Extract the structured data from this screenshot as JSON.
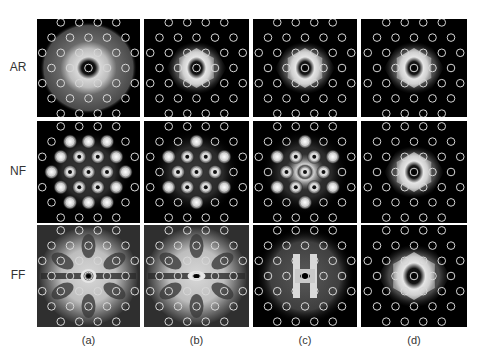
{
  "figure": {
    "row_labels": [
      "AR",
      "NF",
      "FF"
    ],
    "col_labels": [
      "(a)",
      "(b)",
      "(c)",
      "(d)"
    ],
    "panel_background": "#000000",
    "lattice_circle_color": "#d8d8d8",
    "lattice_rows": [
      4,
      5,
      6,
      5,
      6,
      5,
      4
    ]
  },
  "panels": [
    {
      "row": "AR",
      "col": "(a)",
      "pattern": "wide-diffuse-glow-dark-core"
    },
    {
      "row": "AR",
      "col": "(b)",
      "pattern": "hexagonal-ring-dark-core"
    },
    {
      "row": "AR",
      "col": "(c)",
      "pattern": "hexagonal-ring-dark-core"
    },
    {
      "row": "AR",
      "col": "(d)",
      "pattern": "hexagonal-ring-dark-core"
    },
    {
      "row": "NF",
      "col": "(a)",
      "pattern": "bright-spots-at-lattice-sites"
    },
    {
      "row": "NF",
      "col": "(b)",
      "pattern": "bright-spots-inner-lattice"
    },
    {
      "row": "NF",
      "col": "(c)",
      "pattern": "spots-with-central-bright-x"
    },
    {
      "row": "NF",
      "col": "(d)",
      "pattern": "hexagonal-ring-dark-core"
    },
    {
      "row": "FF",
      "col": "(a)",
      "pattern": "wide-bright-flower-ring-core"
    },
    {
      "row": "FF",
      "col": "(b)",
      "pattern": "wide-bright-butterfly"
    },
    {
      "row": "FF",
      "col": "(c)",
      "pattern": "diffuse-with-bright-h-core"
    },
    {
      "row": "FF",
      "col": "(d)",
      "pattern": "hexagonal-glow-dark-core"
    }
  ]
}
